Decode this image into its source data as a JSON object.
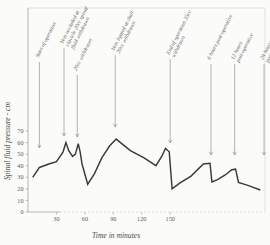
{
  "figure": {
    "background_color": "#fbfbf9",
    "line_color": "#3a3a38",
    "annotation_color": "#66655f"
  },
  "chart_data": {
    "type": "line",
    "title": "",
    "xlabel": "Time in minutes",
    "ylabel": "Spinal fluid pressure - cm",
    "xlim": [
      0,
      250
    ],
    "ylim": [
      0,
      75
    ],
    "xticks": [
      30,
      60,
      90,
      120,
      150
    ],
    "yticks": [
      0,
      10,
      20,
      30,
      40,
      50,
      60,
      70
    ],
    "grid": false,
    "legend": "none",
    "x": [
      5,
      12,
      22,
      30,
      37,
      40,
      43,
      47,
      50,
      53,
      55,
      57,
      63,
      70,
      78,
      86,
      93,
      108,
      122,
      135,
      141,
      145,
      149,
      152,
      160,
      172,
      185,
      192,
      194,
      200,
      208,
      215,
      219,
      222,
      232,
      245
    ],
    "values": [
      30,
      38.5,
      41.5,
      43.5,
      52,
      60,
      53,
      48,
      50,
      59,
      52,
      41.5,
      24,
      33,
      47,
      57,
      63,
      53,
      47,
      40,
      48,
      55,
      52,
      20,
      25,
      31,
      41.5,
      42,
      26,
      28,
      32,
      36.5,
      37,
      25.5,
      23,
      19
    ],
    "series_name": "spinal fluid pressure"
  },
  "annotations": [
    {
      "id": "ann-start-of-operation",
      "label": "Start of operation",
      "x_minute": 12,
      "arrow_top_y": 62,
      "arrow_bottom_y": 148
    },
    {
      "id": "ann-vein-occluded",
      "label": "Vein occluded at clavicle 20cc spinal fluid withdrawn",
      "x_minute": 38,
      "arrow_top_y": 48,
      "arrow_bottom_y": 136
    },
    {
      "id": "ann-20cc-withdrawn",
      "label": "20cc withdrawn",
      "x_minute": 52,
      "arrow_top_y": 75,
      "arrow_bottom_y": 137
    },
    {
      "id": "ann-vein-ligated",
      "label": "Vein ligated at skull 20cc withdrawn",
      "x_minute": 92,
      "arrow_top_y": 55,
      "arrow_bottom_y": 127
    },
    {
      "id": "ann-end-of-operation",
      "label": "End of operation 25cc withdrawn",
      "x_minute": 150,
      "arrow_top_y": 59,
      "arrow_bottom_y": 143
    },
    {
      "id": "ann-6-hours-post-op",
      "label": "6 hours post-operative",
      "x_minute": 193,
      "arrow_top_y": 64,
      "arrow_bottom_y": 155
    },
    {
      "id": "ann-12-hours-post-op",
      "label": "12 hours post-operative",
      "x_minute": 218,
      "arrow_top_y": 64,
      "arrow_bottom_y": 155
    },
    {
      "id": "ann-24-hours-post-op",
      "label": "24 hours post-operative",
      "x_minute": 249,
      "arrow_top_y": 64,
      "arrow_bottom_y": 155
    }
  ]
}
